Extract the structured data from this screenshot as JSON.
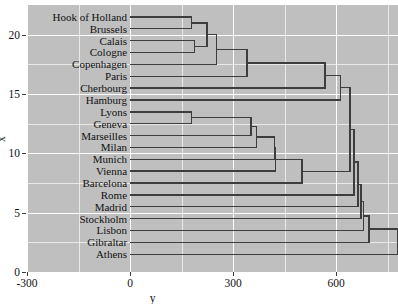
{
  "chart_data": {
    "type": "dendrogram",
    "title": "",
    "xlabel": "y",
    "ylabel": "x",
    "orientation": "horizontal",
    "panel_background": "#bfbfbf",
    "grid": "white gridlines, major and minor",
    "line_color": "#3d3d3d",
    "xlim": [
      -300,
      780
    ],
    "ylim": [
      0,
      22.5
    ],
    "x_ticks": [
      -300,
      0,
      300,
      600
    ],
    "x_tick_labels": [
      "-300",
      "0",
      "300",
      "600"
    ],
    "x_minor_ticks": [
      -150,
      150,
      450,
      750
    ],
    "y_ticks": [
      0,
      5,
      10,
      15,
      20
    ],
    "y_tick_labels": [
      "0",
      "5",
      "10",
      "15",
      "20"
    ],
    "y_minor_ticks": [
      2.5,
      7.5,
      12.5,
      17.5
    ],
    "leaf_start": 0,
    "leaves": [
      {
        "label": "Hook of Holland",
        "pos": 21.5
      },
      {
        "label": "Brussels",
        "pos": 20.5
      },
      {
        "label": "Calais",
        "pos": 19.5
      },
      {
        "label": "Cologne",
        "pos": 18.5
      },
      {
        "label": "Copenhagen",
        "pos": 17.5
      },
      {
        "label": "Paris",
        "pos": 16.5
      },
      {
        "label": "Cherbourg",
        "pos": 15.5
      },
      {
        "label": "Hamburg",
        "pos": 14.5
      },
      {
        "label": "Lyons",
        "pos": 13.5
      },
      {
        "label": "Geneva",
        "pos": 12.5
      },
      {
        "label": "Marseilles",
        "pos": 11.5
      },
      {
        "label": "Milan",
        "pos": 10.5
      },
      {
        "label": "Munich",
        "pos": 9.5
      },
      {
        "label": "Vienna",
        "pos": 8.5
      },
      {
        "label": "Barcelona",
        "pos": 7.5
      },
      {
        "label": "Rome",
        "pos": 6.5
      },
      {
        "label": "Madrid",
        "pos": 5.5
      },
      {
        "label": "Stockholm",
        "pos": 4.5
      },
      {
        "label": "Lisbon",
        "pos": 3.5
      },
      {
        "label": "Gibraltar",
        "pos": 2.5
      },
      {
        "label": "Athens",
        "pos": 1.5
      }
    ],
    "merges": [
      {
        "id": "m1",
        "height": 178,
        "a": {
          "kind": "leaf",
          "pos": 21.5
        },
        "b": {
          "kind": "leaf",
          "pos": 20.5
        }
      },
      {
        "id": "m2",
        "height": 188,
        "a": {
          "kind": "leaf",
          "pos": 19.5
        },
        "b": {
          "kind": "leaf",
          "pos": 18.5
        }
      },
      {
        "id": "m3",
        "height": 224,
        "a": {
          "kind": "node",
          "ref": "m1"
        },
        "b": {
          "kind": "node",
          "ref": "m2"
        }
      },
      {
        "id": "m4",
        "height": 252,
        "a": {
          "kind": "node",
          "ref": "m3"
        },
        "b": {
          "kind": "leaf",
          "pos": 17.5
        }
      },
      {
        "id": "m5",
        "height": 340,
        "a": {
          "kind": "node",
          "ref": "m4"
        },
        "b": {
          "kind": "leaf",
          "pos": 16.5
        }
      },
      {
        "id": "m6",
        "height": 178,
        "a": {
          "kind": "leaf",
          "pos": 13.5
        },
        "b": {
          "kind": "leaf",
          "pos": 12.5
        }
      },
      {
        "id": "m7",
        "height": 352,
        "a": {
          "kind": "node",
          "ref": "m6"
        },
        "b": {
          "kind": "leaf",
          "pos": 11.5
        }
      },
      {
        "id": "m8",
        "height": 368,
        "a": {
          "kind": "node",
          "ref": "m7"
        },
        "b": {
          "kind": "leaf",
          "pos": 10.5
        }
      },
      {
        "id": "m9",
        "height": 420,
        "a": {
          "kind": "node",
          "ref": "m8"
        },
        "b": {
          "kind": "leaf",
          "pos": 9.5
        }
      },
      {
        "id": "m10",
        "height": 424,
        "a": {
          "kind": "node",
          "ref": "m9"
        },
        "b": {
          "kind": "leaf",
          "pos": 8.5
        }
      },
      {
        "id": "m11",
        "height": 500,
        "a": {
          "kind": "node",
          "ref": "m10"
        },
        "b": {
          "kind": "leaf",
          "pos": 7.5
        }
      },
      {
        "id": "m12",
        "height": 568,
        "a": {
          "kind": "node",
          "ref": "m5"
        },
        "b": {
          "kind": "leaf",
          "pos": 15.5
        }
      },
      {
        "id": "m13",
        "height": 612,
        "a": {
          "kind": "node",
          "ref": "m12"
        },
        "b": {
          "kind": "leaf",
          "pos": 14.5
        }
      },
      {
        "id": "m14",
        "height": 640,
        "a": {
          "kind": "node",
          "ref": "m13"
        },
        "b": {
          "kind": "node",
          "ref": "m11"
        }
      },
      {
        "id": "m15",
        "height": 652,
        "a": {
          "kind": "node",
          "ref": "m14"
        },
        "b": {
          "kind": "leaf",
          "pos": 6.5
        }
      },
      {
        "id": "m16",
        "height": 664,
        "a": {
          "kind": "node",
          "ref": "m15"
        },
        "b": {
          "kind": "leaf",
          "pos": 5.5
        }
      },
      {
        "id": "m17",
        "height": 672,
        "a": {
          "kind": "node",
          "ref": "m16"
        },
        "b": {
          "kind": "leaf",
          "pos": 4.5
        }
      },
      {
        "id": "m18",
        "height": 680,
        "a": {
          "kind": "node",
          "ref": "m17"
        },
        "b": {
          "kind": "leaf",
          "pos": 3.5
        }
      },
      {
        "id": "m19",
        "height": 696,
        "a": {
          "kind": "node",
          "ref": "m18"
        },
        "b": {
          "kind": "leaf",
          "pos": 2.5
        }
      },
      {
        "id": "m20",
        "height": 780,
        "a": {
          "kind": "node",
          "ref": "m19"
        },
        "b": {
          "kind": "leaf",
          "pos": 1.5
        }
      }
    ]
  }
}
